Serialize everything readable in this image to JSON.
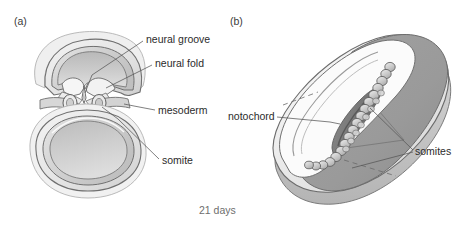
{
  "figure": {
    "title_caption": "21 days",
    "panels": [
      {
        "tag": "(a)",
        "name": "cross-section-view"
      },
      {
        "tag": "(b)",
        "name": "dorsal-3d-view"
      }
    ]
  },
  "labels": {
    "neural_groove": "neural groove",
    "neural_fold": "neural fold",
    "mesoderm": "mesoderm",
    "somite": "somite",
    "notochord": "notochord",
    "somites": "somites"
  },
  "colors": {
    "outline": "#6b6b6b",
    "outline_dark": "#4a4a4a",
    "leader_line": "#555555",
    "amnion_light": "#f2f2f2",
    "cavity_fill": "#cfcfcf",
    "yolk_fill": "#c9c9c9",
    "wall_mid": "#dcdcdc",
    "wall_shade": "#bdbdbd",
    "cut_surface": "#9a9a9a",
    "cut_surface_dark": "#8a8a8a",
    "somite_bead": "#c4c4c4",
    "notochord_dark": "#6f6f6f",
    "text": "#2b2b2b",
    "caption_text": "#6e6e6e",
    "background": "#ffffff"
  },
  "panel_a": {
    "structures": [
      "amniotic-cavity",
      "neural-groove",
      "neural-fold-left",
      "neural-fold-right",
      "somite-left",
      "somite-right",
      "notochord",
      "mesoderm-layer",
      "yolk-sac"
    ]
  },
  "panel_b": {
    "structures": [
      "embryonic-disc",
      "amnion-surface",
      "cut-surface",
      "neural-groove-trough",
      "notochord-rod",
      "somite-chain"
    ],
    "somite_count": 18
  }
}
